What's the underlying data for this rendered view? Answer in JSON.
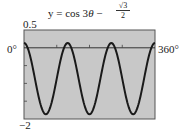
{
  "chart_data": {
    "type": "line",
    "title_parts": {
      "lhs": "y = cos 3",
      "theta": "θ",
      "minus": " − ",
      "num": "√3",
      "den": "2"
    },
    "xlabel": "",
    "ylabel": "",
    "xlim": [
      0,
      360
    ],
    "ylim": [
      -2,
      0.5
    ],
    "x_unit": "degrees",
    "labels": {
      "ymax": "0.5",
      "ymin": "−2",
      "xmin": "0°",
      "xmax": "360°"
    },
    "x_ticks": [
      90,
      180,
      270
    ],
    "y_ticks": [
      -0.5,
      -1,
      -1.5
    ],
    "grid": false,
    "series": [
      {
        "name": "cos 3θ − √3/2",
        "x": [
          0,
          30,
          60,
          90,
          120,
          150,
          180,
          210,
          240,
          270,
          300,
          330,
          360
        ],
        "values": [
          0.134,
          -0.866,
          -1.866,
          -0.866,
          0.134,
          -0.866,
          -1.866,
          -0.866,
          0.134,
          -0.866,
          -1.866,
          -0.866,
          0.134
        ]
      }
    ],
    "colors": {
      "plot_background": "#c8c8c8",
      "curve": "#1a1a1a",
      "axis": "#333333"
    }
  }
}
